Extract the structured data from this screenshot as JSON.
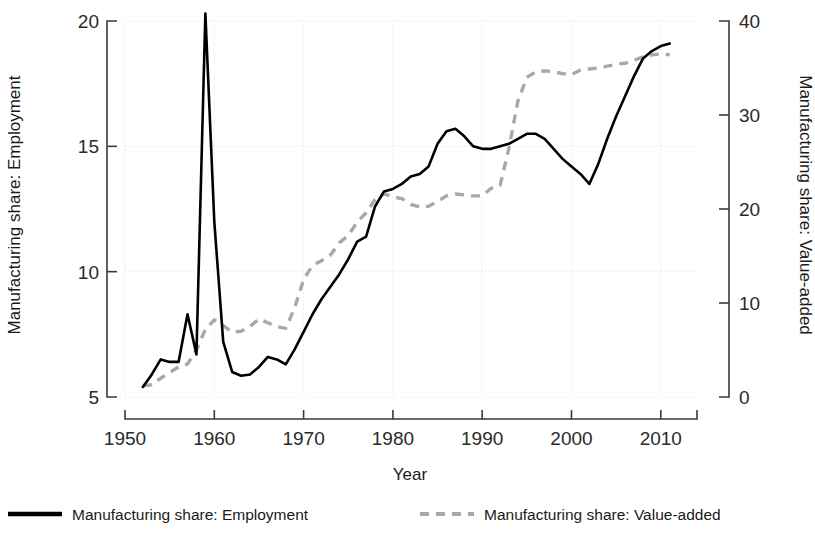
{
  "chart_data": {
    "type": "line",
    "title": "",
    "xlabel": "Year",
    "ylabel": "Manufacturing share: Employment",
    "y2label": "Manufacturing share: Value-added",
    "xlim": [
      1950,
      2013
    ],
    "ylim": [
      5,
      20
    ],
    "y2lim": [
      0,
      40
    ],
    "grid": true,
    "legend_position": "bottom",
    "xticks": [
      "1950",
      "1960",
      "1970",
      "1980",
      "1990",
      "2000",
      "2010"
    ],
    "xtick_values": [
      1950,
      1960,
      1970,
      1980,
      1990,
      2000,
      2010
    ],
    "yticks": [
      "5",
      "10",
      "15",
      "20"
    ],
    "ytick_values": [
      5,
      10,
      15,
      20
    ],
    "y2ticks": [
      "0",
      "10",
      "20",
      "30",
      "40"
    ],
    "y2tick_values": [
      0,
      10,
      20,
      30,
      40
    ],
    "series": [
      {
        "name": "Manufacturing share: Employment",
        "axis": "left",
        "style": "solid",
        "color": "#000000",
        "x": [
          1952,
          1953,
          1954,
          1955,
          1956,
          1957,
          1958,
          1959,
          1960,
          1961,
          1962,
          1963,
          1964,
          1965,
          1966,
          1967,
          1968,
          1969,
          1970,
          1971,
          1972,
          1973,
          1974,
          1975,
          1976,
          1977,
          1978,
          1979,
          1980,
          1981,
          1982,
          1983,
          1984,
          1985,
          1986,
          1987,
          1988,
          1989,
          1990,
          1991,
          1992,
          1993,
          1994,
          1995,
          1996,
          1997,
          1998,
          1999,
          2000,
          2001,
          2002,
          2003,
          2004,
          2005,
          2006,
          2007,
          2008,
          2009,
          2010,
          2011
        ],
        "values": [
          5.4,
          5.9,
          6.5,
          6.4,
          6.4,
          8.3,
          6.7,
          20.3,
          12.0,
          7.2,
          6.0,
          5.85,
          5.9,
          6.2,
          6.6,
          6.5,
          6.3,
          6.9,
          7.6,
          8.3,
          8.9,
          9.4,
          9.9,
          10.5,
          11.2,
          11.4,
          12.6,
          13.2,
          13.3,
          13.5,
          13.8,
          13.9,
          14.2,
          15.1,
          15.6,
          15.7,
          15.4,
          15.0,
          14.9,
          14.9,
          15.0,
          15.1,
          15.3,
          15.5,
          15.5,
          15.3,
          14.9,
          14.5,
          14.2,
          13.9,
          13.5,
          14.3,
          15.3,
          16.2,
          17.0,
          17.8,
          18.5,
          18.8,
          19.0,
          19.1
        ]
      },
      {
        "name": "Manufacturing share: Value-added",
        "axis": "right",
        "style": "dashed",
        "color": "#a8a8a8",
        "x": [
          1952,
          1953,
          1954,
          1955,
          1956,
          1957,
          1958,
          1959,
          1960,
          1961,
          1962,
          1963,
          1964,
          1965,
          1966,
          1967,
          1968,
          1969,
          1970,
          1971,
          1972,
          1973,
          1974,
          1975,
          1976,
          1977,
          1978,
          1979,
          1980,
          1981,
          1982,
          1983,
          1984,
          1985,
          1986,
          1987,
          1988,
          1989,
          1990,
          1991,
          1992,
          1993,
          1994,
          1995,
          1996,
          1997,
          1998,
          1999,
          2000,
          2001,
          2002,
          2003,
          2004,
          2005,
          2006,
          2007,
          2008,
          2009,
          2010,
          2011
        ],
        "values": [
          1.2,
          1.3,
          2.0,
          2.6,
          3.2,
          3.5,
          5.0,
          7.2,
          8.2,
          7.6,
          6.9,
          7.0,
          7.5,
          8.3,
          7.9,
          7.5,
          7.3,
          9.5,
          12.5,
          14.0,
          14.5,
          15.1,
          16.4,
          17.2,
          18.6,
          19.6,
          21.0,
          21.6,
          21.3,
          21.1,
          20.5,
          20.2,
          20.3,
          20.8,
          21.4,
          21.6,
          21.5,
          21.4,
          21.4,
          22.2,
          22.5,
          26.5,
          31.5,
          34.0,
          34.6,
          34.7,
          34.6,
          34.4,
          34.3,
          34.8,
          34.9,
          35.0,
          35.2,
          35.4,
          35.5,
          35.8,
          36.2,
          36.4,
          36.5,
          36.4
        ]
      }
    ],
    "legend": [
      {
        "label": "Manufacturing share: Employment",
        "style": "solid",
        "color": "#000000"
      },
      {
        "label": "Manufacturing share: Value-added",
        "style": "dashed",
        "color": "#a8a8a8"
      }
    ]
  },
  "axes": {
    "x_title": "Year",
    "y_left_title": "Manufacturing share: Employment",
    "y_right_title": "Manufacturing share: Value-added"
  }
}
